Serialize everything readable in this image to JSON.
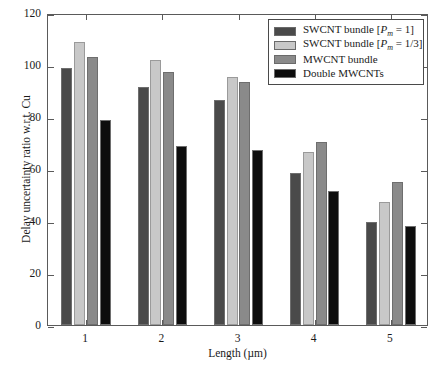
{
  "chart_data": {
    "type": "bar",
    "title": "",
    "xlabel": "Length (µm)",
    "ylabel": "Delay uncertainty ratio w.r.t. Cu",
    "categories": [
      "1",
      "2",
      "3",
      "4",
      "5"
    ],
    "yticks": [
      "0",
      "20",
      "40",
      "60",
      "80",
      "100",
      "120"
    ],
    "ylim": [
      0,
      120
    ],
    "grid": false,
    "legend_position": "top-right",
    "series": [
      {
        "name": "SWCNT bundle [Pm = 1]",
        "legend_html": "SWCNT bundle [<i>P</i><sub>m</sub> = 1]",
        "color": "#4a4a4a",
        "values": [
          99,
          91.5,
          86.5,
          58.5,
          39.5
        ]
      },
      {
        "name": "SWCNT bundle [Pm = 1/3]",
        "legend_html": "SWCNT bundle [<i>P</i><sub>m</sub> = 1/3]",
        "color": "#c8c8c8",
        "values": [
          109,
          102,
          95.5,
          66.5,
          47.5
        ]
      },
      {
        "name": "MWCNT bundle",
        "legend_html": "MWCNT bundle",
        "color": "#8a8a8a",
        "values": [
          103,
          97.5,
          93.5,
          70.5,
          55
        ]
      },
      {
        "name": "Double MWCNTs",
        "legend_html": "Double MWCNTs",
        "color": "#0d0d0d",
        "values": [
          79,
          69,
          67.5,
          51.5,
          38
        ]
      }
    ]
  },
  "axes": {
    "frame_color": "#5a5a5a",
    "background": "#ffffff"
  }
}
